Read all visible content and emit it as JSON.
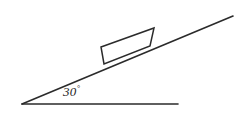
{
  "figure": {
    "background_color": "#ffffff",
    "stroke_color": "#2b2b2b",
    "width": 243,
    "height": 114,
    "angle": {
      "value": "30",
      "degree_symbol": "°",
      "full_label": "30°",
      "position": {
        "x": 63,
        "y": 85
      }
    },
    "incline_line": {
      "name": "inclined-plane-surface",
      "x1": 22,
      "y1": 104,
      "x2": 233,
      "y2": 16
    },
    "baseline_line": {
      "name": "horizontal-base-line",
      "x1": 22,
      "y1": 104,
      "x2": 178,
      "y2": 104
    },
    "vertex": {
      "x": 22,
      "y": 104
    },
    "block": {
      "name": "block-on-incline",
      "points": "101,47 154,28 150,46 104,64",
      "corners": [
        {
          "label": "top-left",
          "x": 101,
          "y": 47
        },
        {
          "label": "top-right",
          "x": 154,
          "y": 28
        },
        {
          "label": "bottom-right",
          "x": 150,
          "y": 46
        },
        {
          "label": "bottom-left",
          "x": 104,
          "y": 64
        }
      ]
    }
  }
}
